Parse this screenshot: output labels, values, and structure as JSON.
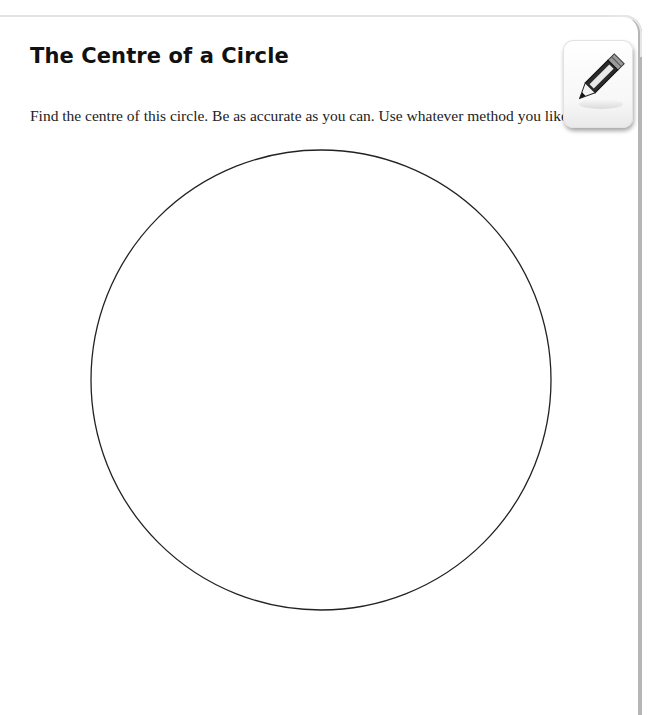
{
  "worksheet": {
    "title": "The Centre of a Circle",
    "instructions": "Find the centre of this circle. Be as accurate as you can. Use whatever method you like.",
    "icon": "pencil-icon",
    "pencil_label": "NEED NEXT"
  },
  "figure": {
    "shape": "circle",
    "center_x": 321,
    "center_y": 380,
    "radius": 230,
    "stroke_color": "#222222"
  }
}
